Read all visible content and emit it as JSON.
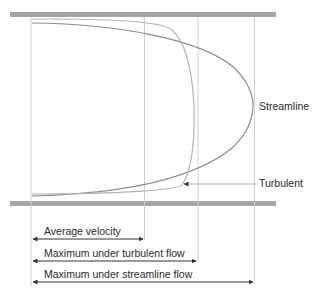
{
  "diagram": {
    "title": "",
    "curves": {
      "streamline_label": "Streamline",
      "turbulent_label": "Turbulent"
    },
    "arrows": [
      {
        "label": "Average velocity"
      },
      {
        "label": "Maximum under turbulent flow"
      },
      {
        "label": "Maximum under streamline flow"
      }
    ],
    "colors": {
      "pipe_wall": "#a6a6a6",
      "streamline_curve": "#8c8c8c",
      "turbulent_curve": "#b3b3b3",
      "guide_lines": "#cfcfcf",
      "arrow": "#333333",
      "text": "#2a2a2a"
    }
  }
}
